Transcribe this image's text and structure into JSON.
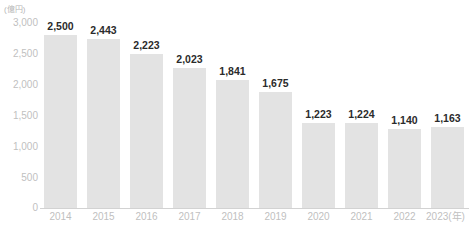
{
  "chart_data": {
    "type": "bar",
    "title": "",
    "subtitle": "",
    "xlabel": "(年)",
    "ylabel": "(億円)",
    "categories": [
      "2014",
      "2015",
      "2016",
      "2017",
      "2018",
      "2019",
      "2020",
      "2021",
      "2022",
      "2023"
    ],
    "values": [
      2500,
      2443,
      2223,
      2023,
      1841,
      1675,
      1223,
      1224,
      1140,
      1163
    ],
    "value_labels": [
      "2,500",
      "2,443",
      "2,223",
      "2,023",
      "1,841",
      "1,675",
      "1,223",
      "1,224",
      "1,140",
      "1,163"
    ],
    "ylim": [
      0,
      3000
    ],
    "ytick_values": [
      3000,
      2500,
      2000,
      1500,
      1000,
      500,
      0
    ],
    "ytick_labels": [
      "3,000",
      "2,500",
      "2,000",
      "1,500",
      "1,000",
      "500",
      "0"
    ],
    "grid": false,
    "legend": false,
    "legend_position": "none",
    "bar_color": "#e3e3e3",
    "axis_color": "#d2d2d2",
    "tick_label_color": "#bfbfbf",
    "value_label_color": "#2b2b2b",
    "background_color": "#ffffff"
  },
  "axes": {
    "y_unit": "(億円)",
    "x_unit": "(年)",
    "x_last_category_with_unit": "2023(年)"
  }
}
